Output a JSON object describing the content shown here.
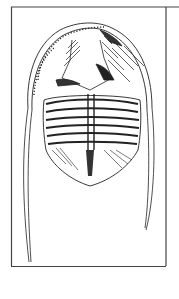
{
  "figure": {
    "colors": {
      "background": "#ffffff",
      "ink": "#222222",
      "border": "#444444"
    }
  }
}
